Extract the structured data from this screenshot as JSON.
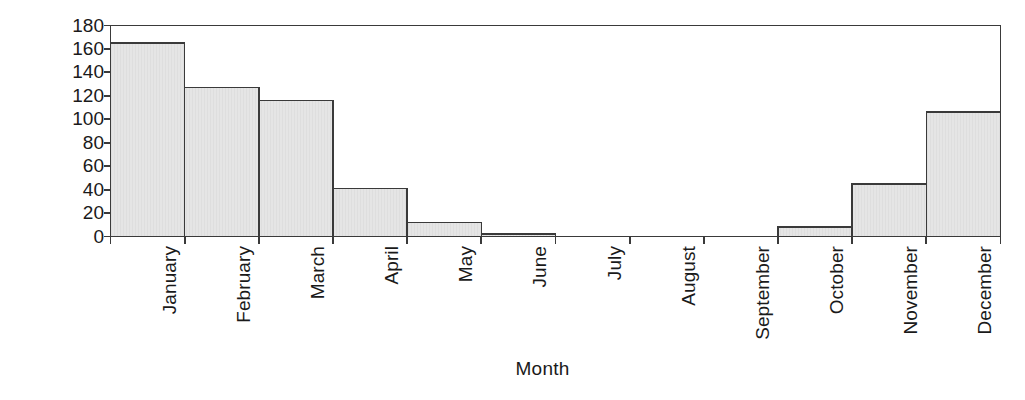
{
  "chart_data": {
    "type": "bar",
    "title": "",
    "xlabel": "Month",
    "ylabel": "Frequency",
    "categories": [
      "January",
      "February",
      "March",
      "April",
      "May",
      "June",
      "July",
      "August",
      "September",
      "October",
      "November",
      "December"
    ],
    "values": [
      165,
      127,
      116,
      41,
      12,
      2,
      0,
      0,
      0,
      8,
      45,
      106
    ],
    "ylim": [
      0,
      180
    ],
    "yticks": [
      0,
      20,
      40,
      60,
      80,
      100,
      120,
      140,
      160,
      180
    ],
    "ytick_labels": [
      "0",
      "20",
      "40",
      "60",
      "80",
      "100",
      "120",
      "140",
      "160",
      "180"
    ],
    "grid": false,
    "legend": false,
    "bar_style": {
      "fill": "#e3e3e3",
      "edge": "#3a3a3a",
      "gap": 0,
      "texture": "fine-vertical-stripes"
    },
    "axis_style": {
      "color": "#3a3a3a",
      "frame": "full-box",
      "tick_direction": "out"
    }
  },
  "axis_titles": {
    "y": "Frequency",
    "x": "Month"
  }
}
